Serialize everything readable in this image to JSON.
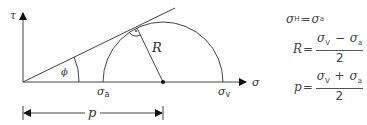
{
  "diagram": {
    "axes": {
      "y_label": "τ",
      "x_label": "σ"
    },
    "angle_label": "ϕ",
    "radius_label": "R",
    "points": {
      "sigma_a": {
        "symbol": "σ",
        "subscript": "a"
      },
      "sigma_v": {
        "symbol": "σ",
        "subscript": "v"
      }
    },
    "dimension_label": "p",
    "right_angle_marker": "·"
  },
  "formulas": [
    {
      "lhs_symbol": "σ",
      "lhs_sub": "H",
      "eq": "=",
      "rhs_symbol": "σ",
      "rhs_sub": "a"
    },
    {
      "lhs": "R",
      "eq": "=",
      "num_a": "σ",
      "num_a_sub": "V",
      "op": "−",
      "num_b": "σ",
      "num_b_sub": "a",
      "den": "2"
    },
    {
      "lhs": "p",
      "eq": "=",
      "num_a": "σ",
      "num_a_sub": "V",
      "op": "+",
      "num_b": "σ",
      "num_b_sub": "a",
      "den": "2"
    }
  ]
}
